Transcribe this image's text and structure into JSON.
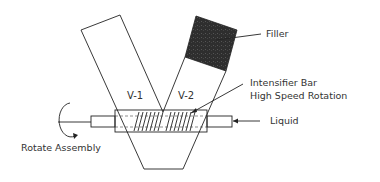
{
  "diagram": {
    "type": "V-blender schematic",
    "labels": {
      "v1": "V-1",
      "v2": "V-2",
      "filler": "Filler",
      "intensifier_line1": "Intensifier Bar",
      "intensifier_line2": "High Speed Rotation",
      "liquid": "Liquid",
      "rotate": "Rotate Assembly"
    },
    "colors": {
      "line": "#222222",
      "filler_fill": "#2e2e2e",
      "text": "#333333",
      "background": "#ffffff"
    }
  }
}
